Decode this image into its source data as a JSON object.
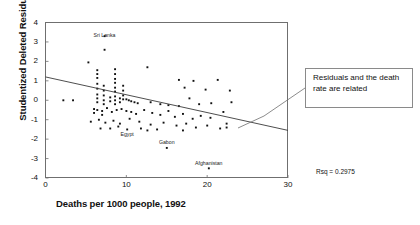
{
  "chart_data": {
    "type": "scatter",
    "title": "",
    "xlabel": "Deaths per 1000 people, 1992",
    "ylabel": "Studentized Deleted Residual",
    "xlim": [
      0,
      30
    ],
    "ylim": [
      -4,
      4
    ],
    "xticks": [
      0,
      10,
      20,
      30
    ],
    "yticks": [
      4,
      3,
      2,
      1,
      0,
      -1,
      -2,
      -3,
      -4
    ],
    "grid": false,
    "legend": null,
    "annotations": [
      {
        "name": "callout",
        "text": "Residuals and the death rate are related"
      },
      {
        "name": "rsq",
        "text": "Rsq = 0.2975"
      }
    ],
    "point_labels": [
      {
        "label": "Sri Lanka",
        "x": 7.3,
        "y": 3.3
      },
      {
        "label": "Egypt",
        "x": 10.1,
        "y": -1.8
      },
      {
        "label": "Gabon",
        "x": 15.0,
        "y": -2.2
      },
      {
        "label": "Afghanistan",
        "x": 20.2,
        "y": -3.3
      }
    ],
    "regression_line": {
      "x": [
        0,
        30
      ],
      "y": [
        1.2,
        -1.55
      ]
    },
    "points": [
      [
        7.3,
        3.3
      ],
      [
        7.3,
        2.6
      ],
      [
        5.3,
        1.95
      ],
      [
        6.4,
        1.55
      ],
      [
        6.4,
        1.35
      ],
      [
        6.4,
        1.15
      ],
      [
        8.6,
        1.6
      ],
      [
        8.6,
        1.35
      ],
      [
        8.6,
        1.1
      ],
      [
        8.6,
        0.9
      ],
      [
        8.6,
        0.65
      ],
      [
        8.6,
        0.45
      ],
      [
        12.6,
        1.7
      ],
      [
        6.4,
        0.85
      ],
      [
        6.4,
        0.6
      ],
      [
        7.2,
        0.75
      ],
      [
        7.2,
        0.5
      ],
      [
        7.2,
        0.25
      ],
      [
        9.6,
        0.75
      ],
      [
        9.6,
        0.5
      ],
      [
        9.6,
        0.25
      ],
      [
        9.6,
        0.05
      ],
      [
        16.5,
        1.05
      ],
      [
        18.3,
        1.0
      ],
      [
        21.3,
        1.05
      ],
      [
        17.2,
        0.65
      ],
      [
        19.8,
        0.55
      ],
      [
        22.8,
        0.5
      ],
      [
        2.2,
        0.0
      ],
      [
        3.4,
        0.0
      ],
      [
        6.4,
        0.3
      ],
      [
        6.4,
        0.1
      ],
      [
        6.4,
        -0.1
      ],
      [
        7.2,
        0.0
      ],
      [
        7.2,
        -0.2
      ],
      [
        8.0,
        0.15
      ],
      [
        8.0,
        -0.05
      ],
      [
        8.6,
        0.2
      ],
      [
        8.6,
        0.0
      ],
      [
        8.6,
        -0.2
      ],
      [
        9.2,
        0.1
      ],
      [
        9.2,
        -0.1
      ],
      [
        10.0,
        0.05
      ],
      [
        10.3,
        0.0
      ],
      [
        10.6,
        -0.05
      ],
      [
        11.0,
        -0.1
      ],
      [
        11.4,
        -0.15
      ],
      [
        13.0,
        -0.1
      ],
      [
        14.2,
        -0.2
      ],
      [
        15.2,
        -0.25
      ],
      [
        16.5,
        -0.3
      ],
      [
        17.8,
        0.1
      ],
      [
        19.0,
        -0.2
      ],
      [
        20.5,
        -0.15
      ],
      [
        23.0,
        -0.1
      ],
      [
        6.0,
        -0.45
      ],
      [
        6.0,
        -0.65
      ],
      [
        6.4,
        -0.5
      ],
      [
        7.0,
        -0.55
      ],
      [
        7.0,
        -0.75
      ],
      [
        7.6,
        -0.4
      ],
      [
        8.2,
        -0.6
      ],
      [
        8.8,
        -0.5
      ],
      [
        9.4,
        -0.45
      ],
      [
        10.0,
        -0.55
      ],
      [
        10.6,
        -0.6
      ],
      [
        11.2,
        -0.7
      ],
      [
        12.2,
        -0.5
      ],
      [
        13.2,
        -0.65
      ],
      [
        14.2,
        -0.75
      ],
      [
        15.2,
        -0.55
      ],
      [
        16.0,
        -0.85
      ],
      [
        17.0,
        -0.7
      ],
      [
        18.2,
        -0.95
      ],
      [
        19.2,
        -0.8
      ],
      [
        20.4,
        -0.9
      ],
      [
        22.0,
        -0.6
      ],
      [
        5.6,
        -1.1
      ],
      [
        6.6,
        -1.0
      ],
      [
        7.4,
        -1.15
      ],
      [
        8.4,
        -1.05
      ],
      [
        9.2,
        -1.2
      ],
      [
        10.4,
        -0.95
      ],
      [
        11.6,
        -1.1
      ],
      [
        13.0,
        -1.25
      ],
      [
        14.6,
        -1.15
      ],
      [
        16.2,
        -1.3
      ],
      [
        17.4,
        -1.2
      ],
      [
        18.6,
        -1.4
      ],
      [
        20.0,
        -1.3
      ],
      [
        21.6,
        -1.45
      ],
      [
        22.4,
        -1.2
      ],
      [
        22.4,
        -1.4
      ],
      [
        10.1,
        -1.5
      ],
      [
        15.0,
        -2.45
      ],
      [
        20.2,
        -3.5
      ],
      [
        9.0,
        -1.35
      ],
      [
        11.8,
        -1.45
      ],
      [
        12.6,
        -1.55
      ],
      [
        8.0,
        -1.45
      ],
      [
        6.8,
        -1.45
      ],
      [
        13.8,
        -1.5
      ],
      [
        17.0,
        -1.55
      ]
    ]
  }
}
